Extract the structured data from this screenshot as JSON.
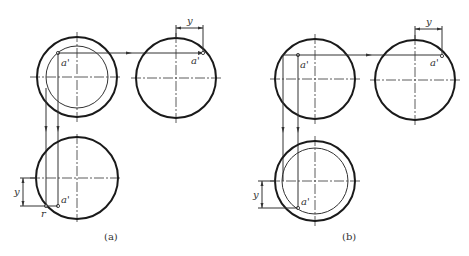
{
  "figure": {
    "panels": [
      {
        "caption": "(a)",
        "point_label": "a'",
        "dimension_label": "y",
        "contact_label": "r"
      },
      {
        "caption": "(b)",
        "point_label": "a'",
        "dimension_label": "y"
      }
    ]
  }
}
